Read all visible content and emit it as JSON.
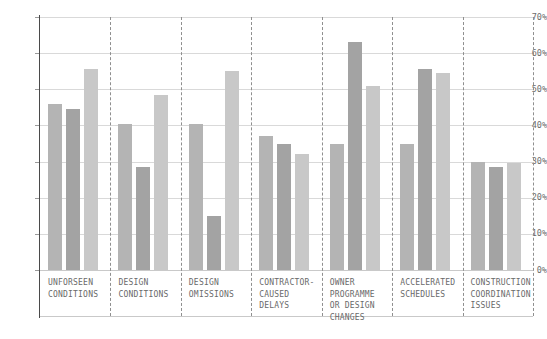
{
  "chart_data": {
    "type": "bar",
    "title": "",
    "subtitle": "",
    "xlabel": "",
    "ylabel": "",
    "ylim": [
      0,
      70
    ],
    "ytick_values": [
      0,
      10,
      20,
      30,
      40,
      50,
      60,
      70
    ],
    "ytick_labels": [
      "0%",
      "10%",
      "20%",
      "30%",
      "40%",
      "50%",
      "60%",
      "70%"
    ],
    "grid": true,
    "legend": "none",
    "value_suffix": "%",
    "categories": [
      "UNFORSEEN\nCONDITIONS",
      "DESIGN\nCONDITIONS",
      "DESIGN\nOMISSIONS",
      "CONTRACTOR-\nCAUSED\nDELAYS",
      "OWNER\nPROGRAMME\nOR DESIGN\nCHANGES",
      "ACCELERATED\nSCHEDULES",
      "CONSTRUCTION\nCOORDINATION\nISSUES"
    ],
    "series": [
      {
        "name": "series-1",
        "color": "#b4b4b4",
        "values": [
          46,
          40.5,
          40.5,
          37,
          35,
          35,
          30
        ]
      },
      {
        "name": "series-2",
        "color": "#a3a3a3",
        "values": [
          44.5,
          28.5,
          15,
          35,
          63,
          55.5,
          28.5
        ]
      },
      {
        "name": "series-3",
        "color": "#c8c8c8",
        "values": [
          55.5,
          48.5,
          55,
          32,
          51,
          54.5,
          29.5
        ]
      }
    ]
  },
  "axis": {
    "axis_line_color": "#4a4a4a",
    "grid_color": "#d9d9d9",
    "separator_color": "#8f8f8f"
  }
}
